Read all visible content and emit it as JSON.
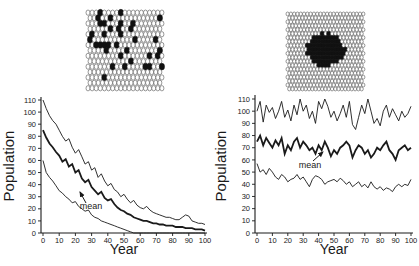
{
  "figure": {
    "background": "#ffffff",
    "ink_color": "#1a1a1a"
  },
  "grids": [
    {
      "name": "scattered-habitat-grid",
      "cols": 19,
      "rows": 15,
      "filled_cells": [
        [
          3,
          0
        ],
        [
          8,
          0
        ],
        [
          2,
          1
        ],
        [
          5,
          1
        ],
        [
          17,
          1
        ],
        [
          3,
          2
        ],
        [
          4,
          2
        ],
        [
          8,
          2
        ],
        [
          11,
          2
        ],
        [
          5,
          3
        ],
        [
          7,
          3
        ],
        [
          10,
          3
        ],
        [
          1,
          4
        ],
        [
          4,
          4
        ],
        [
          8,
          4
        ],
        [
          0,
          5
        ],
        [
          11,
          5
        ],
        [
          16,
          5
        ],
        [
          2,
          6
        ],
        [
          3,
          6
        ],
        [
          4,
          6
        ],
        [
          5,
          6
        ],
        [
          7,
          6
        ],
        [
          4,
          7
        ],
        [
          9,
          7
        ],
        [
          17,
          7
        ],
        [
          8,
          8
        ],
        [
          15,
          8
        ],
        [
          17,
          8
        ],
        [
          10,
          9
        ],
        [
          6,
          10
        ],
        [
          9,
          10
        ],
        [
          14,
          10
        ],
        [
          15,
          10
        ],
        [
          18,
          10
        ],
        [
          4,
          12
        ]
      ]
    },
    {
      "name": "clustered-habitat-grid",
      "cols": 24,
      "rows": 20,
      "blob": {
        "cx": 40,
        "cy": 38,
        "rx": 19,
        "ry": 16.5
      }
    }
  ],
  "chart_data": [
    {
      "type": "line",
      "panel": "left",
      "title": "",
      "xlabel": "Year",
      "ylabel": "Population",
      "xlim": [
        0,
        100
      ],
      "ylim": [
        0,
        110
      ],
      "x_ticks": [
        0,
        10,
        20,
        30,
        40,
        50,
        60,
        70,
        80,
        90,
        100
      ],
      "y_ticks": [
        0,
        10,
        20,
        30,
        40,
        50,
        60,
        70,
        80,
        90,
        100,
        110
      ],
      "grid": false,
      "legend": "none",
      "annotation": {
        "label": "mean",
        "points_to": "middle thick series"
      },
      "x": [
        0,
        2,
        4,
        6,
        8,
        10,
        12,
        14,
        16,
        18,
        20,
        22,
        24,
        26,
        28,
        30,
        32,
        34,
        36,
        38,
        40,
        42,
        44,
        46,
        48,
        50,
        52,
        54,
        56,
        58,
        60,
        62,
        64,
        66,
        68,
        70,
        72,
        74,
        76,
        78,
        80,
        82,
        84,
        86,
        88,
        90,
        92,
        94,
        96,
        98,
        100
      ],
      "series": [
        {
          "name": "upper",
          "emphasis": false,
          "values": [
            110,
            103,
            97,
            93,
            90,
            85,
            80,
            76,
            78,
            71,
            66,
            69,
            63,
            57,
            59,
            52,
            54,
            46,
            49,
            43,
            39,
            41,
            36,
            34,
            30,
            32,
            28,
            25,
            27,
            23,
            21,
            20,
            22,
            19,
            17,
            16,
            15,
            14,
            13,
            13,
            12,
            11,
            11,
            13,
            15,
            14,
            10,
            9,
            8,
            8,
            7
          ]
        },
        {
          "name": "mean",
          "emphasis": true,
          "values": [
            85,
            79,
            74,
            71,
            67,
            64,
            59,
            61,
            55,
            57,
            50,
            52,
            45,
            42,
            44,
            38,
            35,
            32,
            34,
            29,
            27,
            28,
            24,
            21,
            19,
            18,
            16,
            15,
            13,
            12,
            11,
            10,
            10,
            9,
            8,
            8,
            7,
            7,
            6,
            6,
            6,
            5,
            5,
            5,
            4,
            4,
            4,
            3,
            3,
            3,
            2
          ]
        },
        {
          "name": "lower",
          "emphasis": false,
          "values": [
            60,
            50,
            46,
            43,
            39,
            35,
            33,
            30,
            28,
            25,
            26,
            22,
            20,
            18,
            19,
            15,
            13,
            12,
            10,
            9,
            8,
            7,
            6,
            5,
            4,
            3,
            2,
            1,
            0,
            0,
            0,
            0,
            0,
            0,
            0,
            0,
            0,
            0,
            0,
            0,
            0,
            0,
            0,
            0,
            0,
            0,
            0,
            0,
            0,
            0,
            0
          ]
        }
      ]
    },
    {
      "type": "line",
      "panel": "right",
      "title": "",
      "xlabel": "Year",
      "ylabel": "Population",
      "xlim": [
        0,
        100
      ],
      "ylim": [
        0,
        110
      ],
      "x_ticks": [
        0,
        10,
        20,
        30,
        40,
        50,
        60,
        70,
        80,
        90,
        100
      ],
      "y_ticks": [
        0,
        10,
        20,
        30,
        40,
        50,
        60,
        70,
        80,
        90,
        100,
        110
      ],
      "grid": false,
      "legend": "none",
      "annotation": {
        "label": "mean",
        "points_to": "middle thick series"
      },
      "x": [
        0,
        2,
        4,
        6,
        8,
        10,
        12,
        14,
        16,
        18,
        20,
        22,
        24,
        26,
        28,
        30,
        32,
        34,
        36,
        38,
        40,
        42,
        44,
        46,
        48,
        50,
        52,
        54,
        56,
        58,
        60,
        62,
        64,
        66,
        68,
        70,
        72,
        74,
        76,
        78,
        80,
        82,
        84,
        86,
        88,
        90,
        92,
        94,
        96,
        98,
        100
      ],
      "series": [
        {
          "name": "upper",
          "emphasis": false,
          "values": [
            100,
            108,
            91,
            105,
            99,
            103,
            94,
            100,
            108,
            95,
            101,
            92,
            105,
            97,
            110,
            100,
            105,
            94,
            100,
            90,
            108,
            102,
            110,
            104,
            95,
            100,
            92,
            98,
            105,
            95,
            108,
            89,
            85,
            95,
            105,
            98,
            110,
            100,
            90,
            94,
            88,
            100,
            105,
            95,
            102,
            97,
            92,
            100,
            95,
            98,
            104
          ]
        },
        {
          "name": "mean",
          "emphasis": true,
          "values": [
            75,
            80,
            72,
            78,
            74,
            70,
            76,
            72,
            78,
            65,
            72,
            68,
            75,
            78,
            70,
            75,
            72,
            68,
            70,
            65,
            72,
            68,
            75,
            70,
            63,
            68,
            65,
            70,
            72,
            75,
            72,
            62,
            68,
            72,
            70,
            65,
            68,
            62,
            65,
            70,
            68,
            72,
            75,
            68,
            65,
            60,
            68,
            70,
            72,
            68,
            70
          ]
        },
        {
          "name": "lower",
          "emphasis": false,
          "values": [
            57,
            50,
            52,
            48,
            53,
            50,
            46,
            44,
            48,
            46,
            42,
            44,
            45,
            48,
            44,
            46,
            42,
            38,
            44,
            47,
            46,
            44,
            40,
            42,
            43,
            44,
            42,
            45,
            43,
            40,
            42,
            38,
            40,
            42,
            38,
            40,
            37,
            42,
            38,
            36,
            38,
            35,
            37,
            36,
            34,
            38,
            40,
            38,
            40,
            39,
            44
          ]
        }
      ]
    }
  ]
}
